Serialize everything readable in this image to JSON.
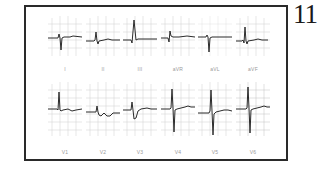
{
  "figure": {
    "page_number": "11",
    "rows": [
      {
        "name": "limb-leads",
        "leads": [
          {
            "label": "I"
          },
          {
            "label": "II"
          },
          {
            "label": "III"
          },
          {
            "label": "aVR"
          },
          {
            "label": "aVL"
          },
          {
            "label": "aVF"
          }
        ]
      },
      {
        "name": "precordial-leads",
        "leads": [
          {
            "label": "V1"
          },
          {
            "label": "V2"
          },
          {
            "label": "V3"
          },
          {
            "label": "V4"
          },
          {
            "label": "V5"
          },
          {
            "label": "V6"
          }
        ]
      }
    ],
    "colors": {
      "trace": "#2b2b2b",
      "grid": "#c9c9c9",
      "frame": "#2a2a2a",
      "label": "#9a9a9a"
    }
  }
}
